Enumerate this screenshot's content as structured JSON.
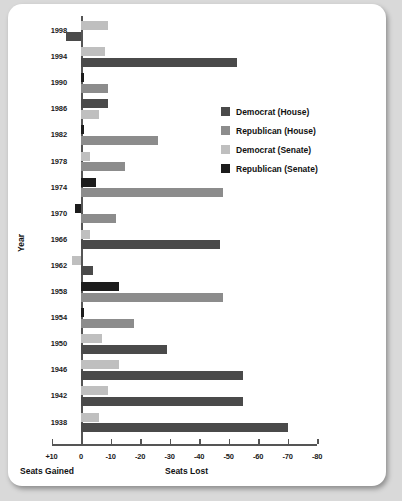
{
  "chart_data": {
    "type": "bar",
    "orientation": "horizontal",
    "title": "",
    "xlabel": "Seats Lost",
    "xlabel_left": "Seats Gained",
    "ylabel": "Year",
    "xlim": [
      10,
      -80
    ],
    "xticks": [
      "+10",
      "0",
      "-10",
      "-20",
      "-30",
      "-40",
      "-50",
      "-60",
      "-70",
      "-80"
    ],
    "xtick_values": [
      10,
      0,
      -10,
      -20,
      -30,
      -40,
      -50,
      -60,
      -70,
      -80
    ],
    "grid": false,
    "legend_position": "upper right",
    "categories": [
      "1998",
      "1994",
      "1990",
      "1986",
      "1982",
      "1978",
      "1974",
      "1970",
      "1966",
      "1962",
      "1958",
      "1954",
      "1950",
      "1946",
      "1942",
      "1938"
    ],
    "series": [
      {
        "name": "Democrat (House)",
        "color": "#4a4a4a",
        "values": [
          5,
          null,
          null,
          -9,
          null,
          null,
          null,
          null,
          -47,
          null,
          null,
          null,
          -29,
          -55,
          -55,
          -70
        ]
      },
      {
        "name": "Republican (House)",
        "color": "#8c8c8c",
        "values": [
          null,
          -53,
          -9,
          null,
          -26,
          -15,
          -48,
          -12,
          null,
          null,
          -48,
          -18,
          null,
          null,
          null,
          null
        ]
      },
      {
        "name": "Democrat (Senate)",
        "color": "#bfbfbf",
        "values": [
          -9,
          -8,
          null,
          -6,
          null,
          -3,
          null,
          null,
          -3,
          3,
          null,
          null,
          -7,
          -13,
          -9,
          -6
        ]
      },
      {
        "name": "Republican (Senate)",
        "color": "#1c1c1c",
        "values": [
          null,
          null,
          -1,
          null,
          -1,
          null,
          -5,
          2,
          null,
          -4,
          -13,
          -1,
          null,
          null,
          null,
          null
        ]
      }
    ],
    "bars": [
      {
        "year": "1998",
        "series": "Democrat (Senate)",
        "value": -9
      },
      {
        "year": "1998",
        "series": "Democrat (House)",
        "value": 5
      },
      {
        "year": "1994",
        "series": "Democrat (Senate)",
        "value": -8
      },
      {
        "year": "1994",
        "series": "Democrat (House)",
        "value": -53
      },
      {
        "year": "1990",
        "series": "Republican (Senate)",
        "value": -1
      },
      {
        "year": "1990",
        "series": "Republican (House)",
        "value": -9
      },
      {
        "year": "1986",
        "series": "Democrat (House)",
        "value": -9
      },
      {
        "year": "1986",
        "series": "Democrat (Senate)",
        "value": -6
      },
      {
        "year": "1982",
        "series": "Republican (Senate)",
        "value": -1
      },
      {
        "year": "1982",
        "series": "Republican (House)",
        "value": -26
      },
      {
        "year": "1978",
        "series": "Democrat (Senate)",
        "value": -3
      },
      {
        "year": "1978",
        "series": "Republican (House)",
        "value": -15
      },
      {
        "year": "1974",
        "series": "Republican (Senate)",
        "value": -5
      },
      {
        "year": "1974",
        "series": "Republican (House)",
        "value": -48
      },
      {
        "year": "1970",
        "series": "Republican (Senate)",
        "value": 2
      },
      {
        "year": "1970",
        "series": "Republican (House)",
        "value": -12
      },
      {
        "year": "1966",
        "series": "Democrat (Senate)",
        "value": -3
      },
      {
        "year": "1966",
        "series": "Democrat (House)",
        "value": -47
      },
      {
        "year": "1962",
        "series": "Democrat (Senate)",
        "value": 3
      },
      {
        "year": "1962",
        "series": "Democrat (House)",
        "value": -4
      },
      {
        "year": "1958",
        "series": "Republican (Senate)",
        "value": -13
      },
      {
        "year": "1958",
        "series": "Republican (House)",
        "value": -48
      },
      {
        "year": "1954",
        "series": "Republican (Senate)",
        "value": -1
      },
      {
        "year": "1954",
        "series": "Republican (House)",
        "value": -18
      },
      {
        "year": "1950",
        "series": "Democrat (Senate)",
        "value": -7
      },
      {
        "year": "1950",
        "series": "Democrat (House)",
        "value": -29
      },
      {
        "year": "1946",
        "series": "Democrat (Senate)",
        "value": -13
      },
      {
        "year": "1946",
        "series": "Democrat (House)",
        "value": -55
      },
      {
        "year": "1942",
        "series": "Democrat (Senate)",
        "value": -9
      },
      {
        "year": "1942",
        "series": "Democrat (House)",
        "value": -55
      },
      {
        "year": "1938",
        "series": "Democrat (Senate)",
        "value": -6
      },
      {
        "year": "1938",
        "series": "Democrat (House)",
        "value": -70
      }
    ]
  },
  "legend": {
    "items": [
      {
        "label": "Democrat (House)",
        "color": "#4a4a4a"
      },
      {
        "label": "Republican (House)",
        "color": "#8c8c8c"
      },
      {
        "label": "Democrat (Senate)",
        "color": "#bfbfbf"
      },
      {
        "label": "Republican (Senate)",
        "color": "#1c1c1c"
      }
    ]
  },
  "axes": {
    "y_title": "Year",
    "x_title_right": "Seats Lost",
    "x_title_left": "Seats Gained"
  },
  "colors": {
    "background": "#d9d9d9",
    "card": "#ffffff",
    "axis": "#555555",
    "text": "#111111"
  }
}
